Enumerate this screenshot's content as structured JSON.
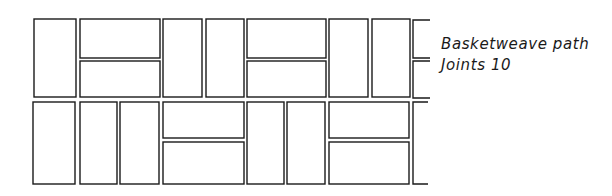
{
  "caption": {
    "title": "Basketweave path",
    "joints": "Joints 10"
  },
  "drawing": {
    "stroke": "#1a1a1a",
    "stroke_width": 1.4,
    "bricks": [
      {
        "row": 1,
        "orientation": "vertical",
        "x": 34,
        "y": 19,
        "w": 42,
        "h": 78
      },
      {
        "row": 1,
        "orientation": "horizontal",
        "x": 80,
        "y": 19,
        "w": 80,
        "h": 39
      },
      {
        "row": 1,
        "orientation": "horizontal",
        "x": 80,
        "y": 61,
        "w": 80,
        "h": 36
      },
      {
        "row": 1,
        "orientation": "vertical",
        "x": 163,
        "y": 19,
        "w": 39,
        "h": 78
      },
      {
        "row": 1,
        "orientation": "vertical",
        "x": 206,
        "y": 19,
        "w": 38,
        "h": 78
      },
      {
        "row": 1,
        "orientation": "horizontal",
        "x": 247,
        "y": 19,
        "w": 79,
        "h": 39
      },
      {
        "row": 1,
        "orientation": "horizontal",
        "x": 247,
        "y": 61,
        "w": 79,
        "h": 36
      },
      {
        "row": 1,
        "orientation": "vertical",
        "x": 329,
        "y": 19,
        "w": 39,
        "h": 78
      },
      {
        "row": 1,
        "orientation": "vertical",
        "x": 372,
        "y": 19,
        "w": 38,
        "h": 78
      },
      {
        "row": 2,
        "orientation": "vertical",
        "x": 33,
        "y": 102,
        "w": 42,
        "h": 82
      },
      {
        "row": 2,
        "orientation": "vertical",
        "x": 80,
        "y": 102,
        "w": 37,
        "h": 82
      },
      {
        "row": 2,
        "orientation": "vertical",
        "x": 120,
        "y": 102,
        "w": 39,
        "h": 82
      },
      {
        "row": 2,
        "orientation": "horizontal",
        "x": 163,
        "y": 102,
        "w": 81,
        "h": 36
      },
      {
        "row": 2,
        "orientation": "horizontal",
        "x": 163,
        "y": 142,
        "w": 81,
        "h": 42
      },
      {
        "row": 2,
        "orientation": "vertical",
        "x": 247,
        "y": 102,
        "w": 37,
        "h": 82
      },
      {
        "row": 2,
        "orientation": "vertical",
        "x": 287,
        "y": 102,
        "w": 38,
        "h": 82
      },
      {
        "row": 2,
        "orientation": "horizontal",
        "x": 329,
        "y": 102,
        "w": 80,
        "h": 36
      },
      {
        "row": 2,
        "orientation": "horizontal",
        "x": 329,
        "y": 142,
        "w": 80,
        "h": 42
      }
    ],
    "partial_bricks": [
      {
        "row": 1,
        "x": 413,
        "y": 20,
        "w": 17,
        "h": 38
      },
      {
        "row": 1,
        "x": 413,
        "y": 61,
        "w": 17,
        "h": 37
      },
      {
        "row": 2,
        "x": 413,
        "y": 102,
        "w": 15,
        "h": 82
      }
    ]
  }
}
